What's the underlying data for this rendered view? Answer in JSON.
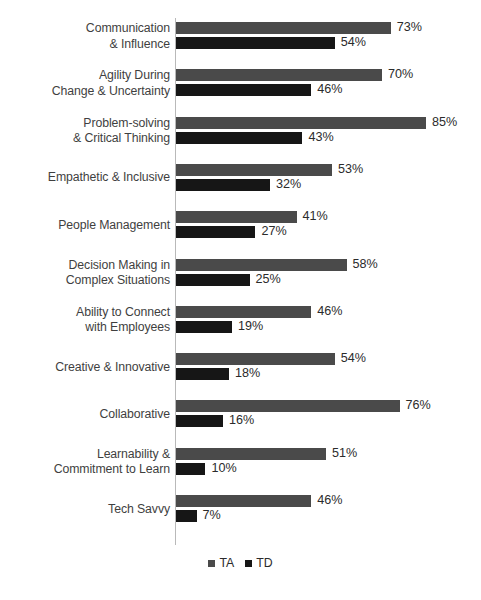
{
  "chart_data": {
    "type": "bar",
    "orientation": "horizontal",
    "title": "",
    "subtitle": "",
    "xlabel": "",
    "ylabel": "",
    "grid": false,
    "legend_position": "bottom-center",
    "xlim": [
      0,
      85
    ],
    "value_suffix": "%",
    "categories": [
      "Communication\n& Influence",
      "Agility During\nChange & Uncertainty",
      "Problem-solving\n& Critical Thinking",
      "Empathetic & Inclusive",
      "People Management",
      "Decision Making in\nComplex Situations",
      "Ability to Connect\nwith Employees",
      "Creative & Innovative",
      "Collaborative",
      "Learnability &\nCommitment to Learn",
      "Tech Savvy"
    ],
    "series": [
      {
        "name": "TA",
        "color": "#4a4a4a",
        "values": [
          73,
          70,
          85,
          53,
          41,
          58,
          46,
          54,
          76,
          51,
          46
        ],
        "labels": [
          "73%",
          "70%",
          "85%",
          "53%",
          "41%",
          "58%",
          "46%",
          "54%",
          "76%",
          "51%",
          "46%"
        ]
      },
      {
        "name": "TD",
        "color": "#161616",
        "values": [
          54,
          46,
          43,
          32,
          27,
          25,
          19,
          18,
          16,
          10,
          7
        ],
        "labels": [
          "54%",
          "46%",
          "43%",
          "32%",
          "27%",
          "25%",
          "19%",
          "18%",
          "16%",
          "10%",
          "7%"
        ]
      }
    ]
  },
  "legend": {
    "items": [
      {
        "label": "TA",
        "color": "#4a4a4a"
      },
      {
        "label": "TD",
        "color": "#161616"
      }
    ]
  }
}
